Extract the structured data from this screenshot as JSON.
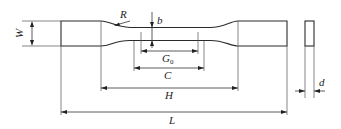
{
  "figure": {
    "labels": {
      "W": "W",
      "R": "R",
      "b": "b",
      "G0_main": "G",
      "G0_sub": "0",
      "C": "C",
      "H": "H",
      "L": "L",
      "d": "d"
    },
    "dimensions": [
      {
        "name": "W",
        "meaning": "grip width"
      },
      {
        "name": "R",
        "meaning": "fillet radius"
      },
      {
        "name": "b",
        "meaning": "gauge section width"
      },
      {
        "name": "G0",
        "meaning": "gauge length"
      },
      {
        "name": "C",
        "meaning": "parallel length"
      },
      {
        "name": "H",
        "meaning": "distance between grips"
      },
      {
        "name": "L",
        "meaning": "overall length"
      },
      {
        "name": "d",
        "meaning": "thickness"
      }
    ],
    "colors": {
      "line": "#2a2a2a",
      "background": "#ffffff"
    }
  }
}
